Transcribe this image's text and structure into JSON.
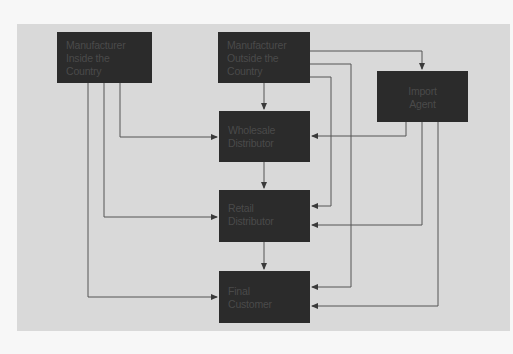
{
  "diagram": {
    "background_color": "#d9d9d9",
    "box_color": "#2b2b2b",
    "line_color": "#555555",
    "nodes": [
      {
        "id": "mfr_inside",
        "lines": [
          "Manufacturer",
          "Inside the",
          "Country"
        ]
      },
      {
        "id": "mfr_outside",
        "lines": [
          "Manufacturer",
          "Outside the",
          "Country"
        ]
      },
      {
        "id": "import_agent",
        "lines": [
          "Import",
          "Agent"
        ]
      },
      {
        "id": "wholesale",
        "lines": [
          "Wholesale",
          "Distributor"
        ]
      },
      {
        "id": "retail",
        "lines": [
          "Retail",
          "Distributor"
        ]
      },
      {
        "id": "final_customer",
        "lines": [
          "Final",
          "Customer"
        ]
      }
    ],
    "edges": [
      {
        "from": "mfr_inside",
        "to": "wholesale"
      },
      {
        "from": "mfr_inside",
        "to": "retail"
      },
      {
        "from": "mfr_inside",
        "to": "final_customer"
      },
      {
        "from": "mfr_outside",
        "to": "wholesale"
      },
      {
        "from": "mfr_outside",
        "to": "import_agent"
      },
      {
        "from": "mfr_outside",
        "to": "retail"
      },
      {
        "from": "mfr_outside",
        "to": "final_customer"
      },
      {
        "from": "import_agent",
        "to": "wholesale"
      },
      {
        "from": "import_agent",
        "to": "retail"
      },
      {
        "from": "import_agent",
        "to": "final_customer"
      },
      {
        "from": "wholesale",
        "to": "retail"
      },
      {
        "from": "retail",
        "to": "final_customer"
      }
    ]
  }
}
